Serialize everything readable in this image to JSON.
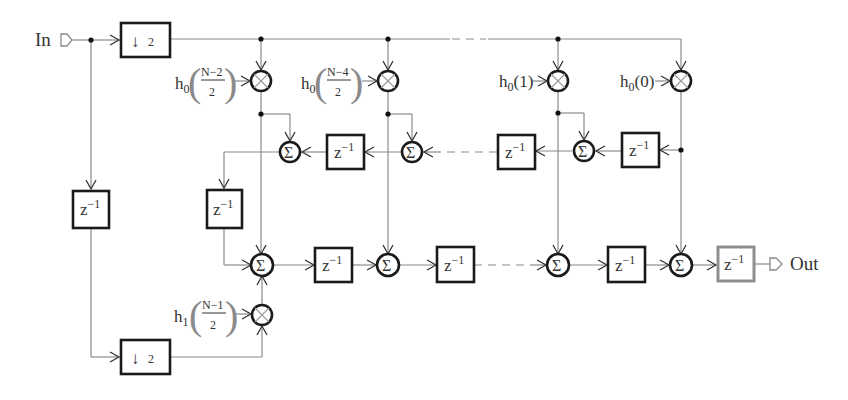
{
  "diagram": {
    "title": "",
    "type": "polyphase decimation FIR filter block diagram",
    "ports": {
      "input_label": "In",
      "output_label": "Out"
    },
    "decimators": [
      {
        "id": "dec-top",
        "label_arrow": "↓",
        "label_factor": "2"
      },
      {
        "id": "dec-bottom",
        "label_arrow": "↓",
        "label_factor": "2"
      }
    ],
    "delay": {
      "base": "z",
      "exp": "−1"
    },
    "sum_symbol": "Σ",
    "multipliers": [
      {
        "id": "mult-col1",
        "coef_base": "h",
        "coef_sub": "0",
        "frac_num": "N−2",
        "frac_den": "2"
      },
      {
        "id": "mult-col2",
        "coef_base": "h",
        "coef_sub": "0",
        "frac_num": "N−4",
        "frac_den": "2"
      },
      {
        "id": "mult-col3",
        "coef_base": "h",
        "coef_sub": "0",
        "arg": "(1)"
      },
      {
        "id": "mult-col4",
        "coef_base": "h",
        "coef_sub": "0",
        "arg": "(0)"
      },
      {
        "id": "mult-bottom",
        "coef_base": "h",
        "coef_sub": "1",
        "frac_num": "N−1",
        "frac_den": "2"
      }
    ],
    "colors": {
      "wire": "#8a8a8a",
      "block_border": "#1a1a1a",
      "output_delay_border": "#8f8f8f",
      "text": "#333333",
      "background": "#ffffff"
    }
  }
}
